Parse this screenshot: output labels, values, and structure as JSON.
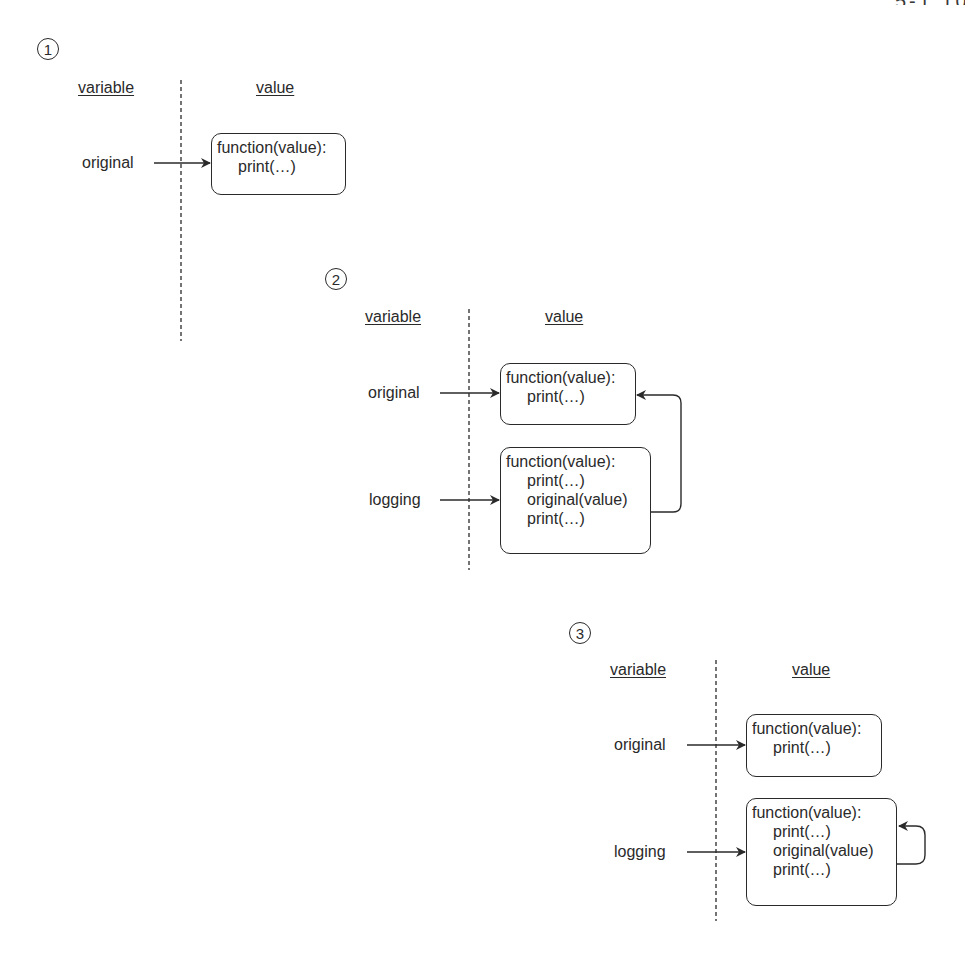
{
  "colors": {
    "ink": "#2a2a2a",
    "background": "#ffffff"
  },
  "header_fragment": {
    "text": "5-1 10.55",
    "note_visible": "clipped, illegible page header at top-right"
  },
  "diagrams": [
    {
      "step": "1",
      "headers": {
        "variable": "variable",
        "value": "value"
      },
      "variables": [
        {
          "name": "original",
          "points_to": 0
        }
      ],
      "values": [
        {
          "lines": [
            "function(value):",
            "print(…)"
          ]
        }
      ],
      "connectors": []
    },
    {
      "step": "2",
      "headers": {
        "variable": "variable",
        "value": "value"
      },
      "variables": [
        {
          "name": "original",
          "points_to": 0
        },
        {
          "name": "logging",
          "points_to": 1
        }
      ],
      "values": [
        {
          "lines": [
            "function(value):",
            "print(…)"
          ]
        },
        {
          "lines": [
            "function(value):",
            "print(…)",
            "original(value)",
            "print(…)"
          ]
        }
      ],
      "connectors": [
        {
          "from": "values.1.line.original(value)",
          "to": "values.0"
        }
      ]
    },
    {
      "step": "3",
      "headers": {
        "variable": "variable",
        "value": "value"
      },
      "variables": [
        {
          "name": "original",
          "points_to": 0
        },
        {
          "name": "logging",
          "points_to": 1
        }
      ],
      "values": [
        {
          "lines": [
            "function(value):",
            "print(…)"
          ]
        },
        {
          "lines": [
            "function(value):",
            "print(…)",
            "original(value)",
            "print(…)"
          ]
        }
      ],
      "connectors": [
        {
          "from": "values.1.line.original(value)",
          "to": "values.1"
        }
      ]
    }
  ]
}
